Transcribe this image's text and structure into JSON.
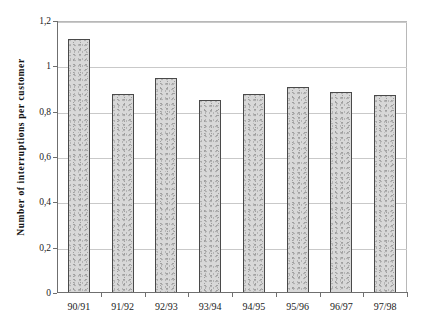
{
  "chart_data": {
    "type": "bar",
    "title": "",
    "subtitle": "",
    "xlabel": "",
    "ylabel": "Number of interruptions per customer",
    "categories": [
      "90/91",
      "91/92",
      "92/93",
      "93/94",
      "94/95",
      "95/96",
      "96/97",
      "97/98"
    ],
    "values": [
      1.12,
      0.88,
      0.95,
      0.85,
      0.88,
      0.91,
      0.885,
      0.875
    ],
    "ylim": [
      0,
      1.2
    ],
    "ytick_values": [
      0,
      0.2,
      0.4,
      0.6,
      0.8,
      1.0,
      1.2
    ],
    "ytick_labels": [
      "0",
      "0,2",
      "0,4",
      "0,6",
      "0,8",
      "1",
      "1,2"
    ],
    "decimal_separator": ",",
    "grid": "horizontal",
    "legend": "none",
    "annotations": [],
    "colors": {
      "bar_fill": "#d8d8d8",
      "bar_edge": "#4a4a4a",
      "gridline": "#c9c9c9",
      "axis": "#6f6f6f",
      "text": "#1a1a1a",
      "background": "#ffffff"
    }
  }
}
